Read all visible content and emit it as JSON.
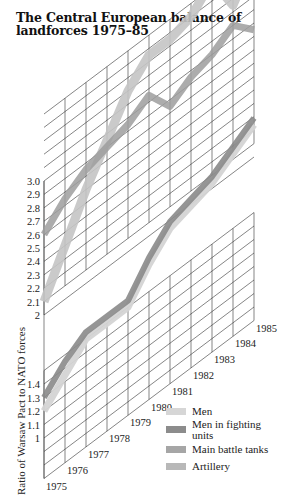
{
  "title": "The Central European balance of landforces 1975–85",
  "chart_data": {
    "type": "line",
    "title": "The Central European balance of landforces 1975–85",
    "xlabel": "",
    "ylabel": "Ratio of Warsaw Pact to NATO forces",
    "x": [
      1975,
      1976,
      1977,
      1978,
      1979,
      1980,
      1981,
      1982,
      1983,
      1984,
      1985
    ],
    "y_axis_break": true,
    "y_ticks_lower": [
      "1",
      "1.1",
      "1.2",
      "1.3",
      "1.4"
    ],
    "y_ticks_upper": [
      "2",
      "2.1",
      "2.2",
      "2.3",
      "2.4",
      "2.5",
      "2.6",
      "2.7",
      "2.8",
      "2.9",
      "3.0"
    ],
    "ylim_lower": [
      0.7,
      1.5
    ],
    "ylim_upper": [
      2.0,
      3.0
    ],
    "grid": true,
    "legend_position": "bottom-right",
    "series": [
      {
        "name": "Men",
        "color": "#d9d9d9",
        "values": [
          1.2,
          1.35,
          1.45,
          1.5,
          1.5,
          1.5,
          1.5,
          1.5,
          1.5,
          1.5,
          1.5
        ]
      },
      {
        "name": "Men in fighting units",
        "color": "#8a8a8a",
        "values": [
          1.3,
          1.45,
          1.5,
          1.5,
          1.5,
          1.5,
          1.5,
          1.5,
          1.5,
          1.5,
          1.5
        ]
      },
      {
        "name": "Main battle tanks",
        "color": "#a8a8a8",
        "values": [
          2.6,
          2.75,
          2.8,
          2.85,
          2.9,
          2.9,
          2.8,
          2.85,
          2.85,
          2.95,
          2.85
        ]
      },
      {
        "name": "Artillery",
        "color": "#bdbdbd",
        "values": [
          2.1,
          2.4,
          2.65,
          2.8,
          3.1,
          3.3,
          3.3,
          3.3,
          3.45,
          3.2,
          3.4
        ]
      }
    ]
  },
  "axis": {
    "ylabel": "Ratio of Warsaw Pact to NATO forces",
    "years": [
      "1975",
      "1976",
      "1977",
      "1978",
      "1979",
      "1980",
      "1981",
      "1982",
      "1983",
      "1984",
      "1985"
    ],
    "upper_ticks": [
      "3.0",
      "2.9",
      "2.8",
      "2.7",
      "2.6",
      "2.5",
      "2.4",
      "2.3",
      "2.2",
      "2.1",
      "2"
    ],
    "lower_ticks": [
      "1.4",
      "1.3",
      "1.2",
      "1.1",
      "1"
    ]
  },
  "legend": [
    {
      "label": "Men",
      "color": "#d6d6d6"
    },
    {
      "label": "Men in fighting units",
      "color": "#8c8c8c"
    },
    {
      "label": "Main battle tanks",
      "color": "#a6a6a6"
    },
    {
      "label": "Artillery",
      "color": "#b8b8b8"
    }
  ]
}
